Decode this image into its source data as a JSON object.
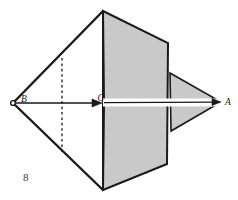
{
  "figure": {
    "number": "8",
    "caption_text": "8",
    "background_color": "#ffffff",
    "shade_color": "#c9c9c9",
    "stroke_color": "#1a1a1a",
    "width": 238,
    "height": 200
  },
  "labels": {
    "a": "A",
    "b": "B",
    "c": "C"
  },
  "points": {
    "B": {
      "x": 13,
      "y": 103
    },
    "C": {
      "x": 104,
      "y": 103
    },
    "A": {
      "x": 221,
      "y": 102
    },
    "top_apex": {
      "x": 103,
      "y": 11
    },
    "bottom_apex": {
      "x": 103,
      "y": 190
    },
    "panel_top_right": {
      "x": 168,
      "y": 43
    },
    "panel_bottom_right": {
      "x": 167,
      "y": 164
    },
    "wing_top": {
      "x": 170,
      "y": 73
    },
    "wing_bottom": {
      "x": 171,
      "y": 131
    },
    "dashed_top": {
      "x": 62,
      "y": 58
    },
    "dashed_bottom": {
      "x": 62,
      "y": 152
    }
  },
  "elements": {
    "shaded_panel_name": "shaded-plane-panel",
    "shaded_wing_name": "shaded-wing-triangle",
    "axis_name": "axis-arrow-B-to-C",
    "axis_long_name": "axis-arrow-C-to-A",
    "dashed_name": "dashed-fold-line"
  },
  "axis_arrows": {
    "short_from": "B",
    "short_to": "C",
    "long_from": "C",
    "long_to": "A"
  }
}
